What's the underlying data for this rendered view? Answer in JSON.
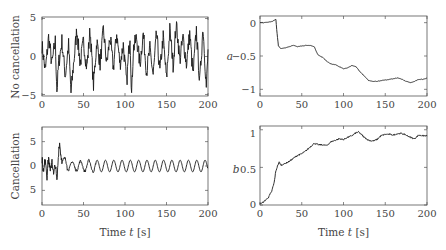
{
  "chart_data": [
    {
      "id": "top-left",
      "type": "line",
      "title": "",
      "xlabel": "",
      "ylabel": "No cancellation",
      "xlim": [
        0,
        200
      ],
      "ylim": [
        -5,
        5
      ],
      "xticks": [
        "0",
        "50",
        "100",
        "150",
        "200"
      ],
      "yticks": [
        "5",
        "0",
        "−5"
      ],
      "grid": false,
      "description": "Noisy signal oscillating roughly between -5 and 4.5 for entire 200 s",
      "x": [
        0,
        4,
        8,
        12,
        16,
        18,
        20,
        24,
        28,
        32,
        35,
        38,
        42,
        46,
        50,
        54,
        58,
        62,
        66,
        70,
        74,
        78,
        82,
        86,
        90,
        94,
        98,
        102,
        106,
        108,
        110,
        114,
        118,
        122,
        126,
        130,
        134,
        138,
        142,
        146,
        150,
        154,
        158,
        162,
        166,
        170,
        174,
        178,
        182,
        186,
        190,
        194,
        198,
        200
      ],
      "values": [
        1.5,
        -2,
        2.5,
        -1,
        2,
        -4.5,
        -1,
        2,
        -2.5,
        1.5,
        -4.8,
        -1,
        3.5,
        -1,
        2,
        -1.5,
        3.5,
        -3.8,
        2,
        -1,
        3.5,
        -1,
        2.5,
        -1.5,
        3,
        -1,
        1.5,
        -3.5,
        3,
        -5,
        1,
        2.5,
        -1,
        3,
        -2,
        1,
        -2.5,
        3,
        -2,
        2.5,
        -3,
        3.5,
        -1,
        4.5,
        -0.5,
        2.5,
        -1,
        3,
        -2.5,
        3.5,
        -3.5,
        4,
        -4,
        0.5
      ]
    },
    {
      "id": "top-right",
      "type": "line",
      "title": "",
      "xlabel": "",
      "ylabel": "a",
      "xlim": [
        0,
        200
      ],
      "ylim": [
        -1.1,
        0.1
      ],
      "xticks": [
        "0",
        "50",
        "100",
        "150",
        "200"
      ],
      "yticks": [
        "0",
        "−0.5",
        "−1"
      ],
      "grid": false,
      "x": [
        0,
        5,
        10,
        15,
        19,
        20,
        22,
        25,
        30,
        35,
        40,
        45,
        50,
        55,
        60,
        65,
        68,
        70,
        75,
        80,
        85,
        90,
        95,
        100,
        105,
        110,
        115,
        120,
        125,
        130,
        135,
        140,
        145,
        150,
        155,
        160,
        165,
        170,
        175,
        180,
        185,
        190,
        195,
        200
      ],
      "values": [
        0.0,
        0.0,
        0.01,
        0.02,
        0.05,
        -0.1,
        -0.35,
        -0.39,
        -0.38,
        -0.36,
        -0.34,
        -0.36,
        -0.35,
        -0.34,
        -0.34,
        -0.36,
        -0.45,
        -0.49,
        -0.52,
        -0.58,
        -0.62,
        -0.63,
        -0.66,
        -0.69,
        -0.68,
        -0.64,
        -0.66,
        -0.74,
        -0.8,
        -0.87,
        -0.88,
        -0.88,
        -0.87,
        -0.86,
        -0.85,
        -0.84,
        -0.83,
        -0.85,
        -0.88,
        -0.9,
        -0.88,
        -0.85,
        -0.85,
        -0.83
      ]
    },
    {
      "id": "bottom-left",
      "type": "line",
      "title": "",
      "xlabel": "Time t [s]",
      "ylabel": "Cancellation",
      "xlim": [
        0,
        200
      ],
      "ylim": [
        -8,
        8
      ],
      "xticks": [
        "0",
        "50",
        "100",
        "150",
        "200"
      ],
      "yticks": [
        "5",
        "0",
        "5"
      ],
      "grid": false,
      "description": "Noisy transient for t<25 s (peak ~5 at 21 s, trough ~-3.5 at 18 s), then sinusoid of amplitude ~1.2 and period ~10 s",
      "transient": {
        "x": [
          0,
          2,
          4,
          6,
          8,
          10,
          12,
          14,
          16,
          18,
          20,
          21,
          23,
          25,
          28,
          30
        ],
        "values": [
          1.5,
          -1.5,
          1.8,
          -2,
          1.8,
          -1.5,
          1.5,
          -2,
          0.5,
          -3.5,
          3,
          5,
          2,
          0.5,
          1,
          0.8
        ]
      },
      "oscillation": {
        "start": 30,
        "end": 200,
        "amplitude": 1.2,
        "period": 10
      }
    },
    {
      "id": "bottom-right",
      "type": "line",
      "title": "",
      "xlabel": "Time t [s]",
      "ylabel": "b",
      "xlim": [
        0,
        200
      ],
      "ylim": [
        0,
        1.05
      ],
      "xticks": [
        "0",
        "50",
        "100",
        "150",
        "200"
      ],
      "yticks": [
        "1",
        "0.5",
        "0"
      ],
      "grid": false,
      "x": [
        0,
        3,
        6,
        10,
        14,
        17,
        19,
        21,
        23,
        25,
        30,
        35,
        40,
        45,
        50,
        55,
        60,
        65,
        70,
        75,
        80,
        85,
        90,
        95,
        100,
        105,
        110,
        115,
        118,
        120,
        125,
        130,
        135,
        140,
        145,
        150,
        155,
        160,
        165,
        170,
        175,
        180,
        185,
        190,
        195,
        200
      ],
      "values": [
        0.02,
        0.03,
        0.06,
        0.1,
        0.18,
        0.3,
        0.45,
        0.52,
        0.57,
        0.53,
        0.55,
        0.58,
        0.62,
        0.66,
        0.68,
        0.72,
        0.77,
        0.82,
        0.8,
        0.8,
        0.79,
        0.84,
        0.86,
        0.88,
        0.87,
        0.9,
        0.92,
        0.96,
        0.97,
        0.95,
        0.9,
        0.86,
        0.85,
        0.87,
        0.92,
        0.94,
        0.94,
        0.93,
        0.95,
        0.95,
        0.93,
        0.9,
        0.88,
        0.93,
        0.92,
        0.92
      ]
    }
  ],
  "labels": {
    "tl_ylabel": "No cancellation",
    "bl_ylabel": "Cancellation",
    "tr_ylabel": "a",
    "br_ylabel": "b",
    "xlabel_prefix": "Time ",
    "xlabel_var": "t",
    "xlabel_unit": " [s]",
    "xticks": [
      "0",
      "50",
      "100",
      "150",
      "200"
    ],
    "tl_yticks": [
      "5",
      "0",
      "−5"
    ],
    "tr_yticks": [
      "0",
      "−0.5",
      "−1"
    ],
    "bl_yticks": [
      "5",
      "0",
      "5"
    ],
    "br_yticks": [
      "1",
      "0.5",
      "0"
    ]
  },
  "colors": {
    "line": "#1a1a1a",
    "frame": "#555555",
    "text": "#444444"
  }
}
